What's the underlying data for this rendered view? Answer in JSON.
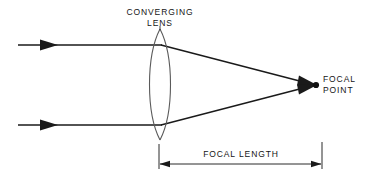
{
  "diagram": {
    "labels": {
      "converging_lens_line1": "CONVERGING",
      "converging_lens_line2": "LENS",
      "focal_point_line1": "FOCAL",
      "focal_point_line2": "POINT",
      "focal_length": "FOCAL LENGTH"
    },
    "colors": {
      "background": "#ffffff",
      "stroke": "#1a1a1a",
      "text": "#151515",
      "lens_outline": "#555555"
    },
    "geometry": {
      "lens_center_x": 160,
      "lens_top_y": 29,
      "lens_bottom_y": 140,
      "lens_half_width": 13,
      "upper_ray_y": 45,
      "lower_ray_y": 125,
      "ray_start_x": 18,
      "focal_point_x": 316,
      "focal_point_y": 85,
      "dimension_line_y": 164,
      "dimension_left_x": 159,
      "dimension_right_x": 322
    },
    "icons": {
      "upper_ray_arrow": "arrow-right-icon",
      "lower_ray_arrow": "arrow-right-icon",
      "focal_point_marker": "dot-icon",
      "dimension_left_arrow": "arrow-left-icon",
      "dimension_right_arrow": "arrow-right-icon"
    }
  }
}
